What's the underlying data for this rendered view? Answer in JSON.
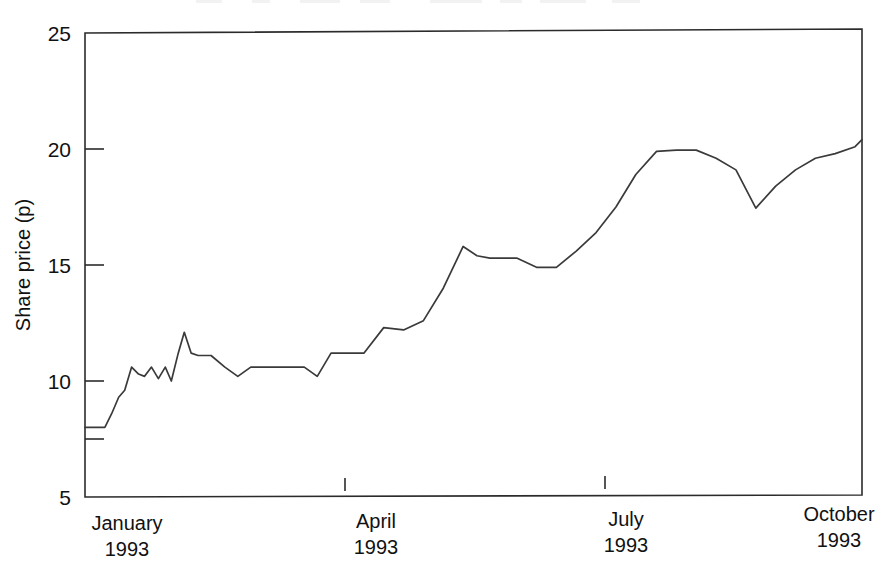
{
  "chart_data": {
    "type": "line",
    "title": "",
    "subtitle": "",
    "xlabel": "",
    "ylabel": "Share price (p)",
    "ylim": [
      5,
      25
    ],
    "yticks": [
      5,
      10,
      15,
      20,
      25
    ],
    "ytick_labels": [
      "5",
      "10",
      "15",
      "20",
      "25"
    ],
    "xticks": [
      "January 1993",
      "April 1993",
      "July 1993",
      "October 1993"
    ],
    "xtick_labels": [
      {
        "month": "January",
        "year": "1993"
      },
      {
        "month": "April",
        "year": "1993"
      },
      {
        "month": "July",
        "year": "1993"
      },
      {
        "month": "October",
        "year": "1993"
      }
    ],
    "grid": false,
    "legend": false,
    "legend_position": "none",
    "line_color": "#3a3a3a",
    "frame_color": "#2b2b2b",
    "background": "#ffffff",
    "x_axis_type": "time",
    "x_domain": [
      "January 1993",
      "October 1993"
    ],
    "series": [
      {
        "name": "Share price",
        "units": "pence",
        "x": [
          0.0,
          0.23,
          0.31,
          0.39,
          0.46,
          0.54,
          0.62,
          0.69,
          0.77,
          0.85,
          0.93,
          1.0,
          1.08,
          1.15,
          1.23,
          1.31,
          1.46,
          1.62,
          1.77,
          1.92,
          2.08,
          2.23,
          2.38,
          2.54,
          2.69,
          2.85,
          3.0,
          3.23,
          3.46,
          3.69,
          3.92,
          4.15,
          4.38,
          4.54,
          4.69,
          4.85,
          5.0,
          5.23,
          5.46,
          5.69,
          5.92,
          6.15,
          6.38,
          6.62,
          6.85,
          7.08,
          7.31,
          7.54,
          7.77,
          8.0,
          8.23,
          8.46,
          8.69,
          8.92,
          9.0
        ],
        "values": [
          8.0,
          8.0,
          8.6,
          9.3,
          9.6,
          10.6,
          10.3,
          10.2,
          10.6,
          10.1,
          10.6,
          10.0,
          11.2,
          12.1,
          11.2,
          11.1,
          11.1,
          10.6,
          10.2,
          10.6,
          10.6,
          10.6,
          10.6,
          10.6,
          10.2,
          11.2,
          11.2,
          11.2,
          12.3,
          12.2,
          12.6,
          14.0,
          15.8,
          15.4,
          15.3,
          15.3,
          15.3,
          14.9,
          14.9,
          15.6,
          16.4,
          17.5,
          18.9,
          19.9,
          19.95,
          19.95,
          19.6,
          19.1,
          17.45,
          18.4,
          19.1,
          19.6,
          19.8,
          20.1,
          20.4
        ]
      }
    ],
    "annotations": [],
    "data_notes": "Daily/weekly share price, January 1993 through October 1993; starts flat at 8p, trends upward to about 20.4p with a sharp dip to 17.45p in September."
  },
  "axis": {
    "y_title": "Share price (p)",
    "y_tick_5": "5",
    "y_tick_10": "10",
    "y_tick_15": "15",
    "y_tick_20": "20",
    "y_tick_25": "25",
    "x_cat_1_month": "January",
    "x_cat_1_year": "1993",
    "x_cat_2_month": "April",
    "x_cat_2_year": "1993",
    "x_cat_3_month": "July",
    "x_cat_3_year": "1993",
    "x_cat_4_month": "October",
    "x_cat_4_year": "1993"
  }
}
